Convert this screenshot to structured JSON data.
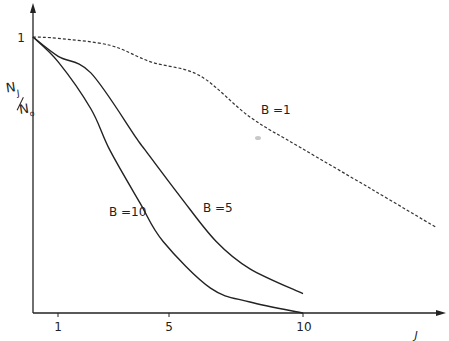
{
  "chart_data": {
    "type": "line",
    "title": "",
    "xlabel": "J",
    "ylabel": "N_J / N_0",
    "ylabel_parts": {
      "num": "N",
      "num_sub": "J",
      "den": "N",
      "den_sub": "o"
    },
    "xlim": [
      0,
      15
    ],
    "ylim": [
      0,
      1
    ],
    "x_ticks": [
      1,
      5,
      10
    ],
    "y_ticks": [
      1
    ],
    "grid": false,
    "legend": "inline labels",
    "series": [
      {
        "name": "B = 1",
        "label": "B =1",
        "style": "dashed",
        "x": [
          0,
          1,
          2.9,
          4.4,
          6.2,
          8.05,
          9.9,
          12.5,
          14.9
        ],
        "y": [
          1.0,
          0.995,
          0.97,
          0.91,
          0.86,
          0.71,
          0.6,
          0.45,
          0.31
        ]
      },
      {
        "name": "B = 5",
        "label": "B =5",
        "style": "solid",
        "x": [
          0,
          1,
          2.2,
          3.9,
          4.2,
          5.5,
          6.8,
          8.05,
          10
        ],
        "y": [
          1.0,
          0.93,
          0.87,
          0.63,
          0.59,
          0.42,
          0.26,
          0.16,
          0.07
        ]
      },
      {
        "name": "B = 10",
        "label": "B =10",
        "style": "solid",
        "x": [
          0,
          1,
          2.2,
          2.9,
          4.0,
          4.85,
          6.6,
          8.05,
          10
        ],
        "y": [
          1.0,
          0.91,
          0.74,
          0.59,
          0.4,
          0.26,
          0.09,
          0.04,
          0.0
        ]
      }
    ]
  },
  "labels": {
    "y_tick_1": "1",
    "x_tick_1": "1",
    "x_tick_5": "5",
    "x_tick_10": "10",
    "x_axis": "J",
    "y_num": "N",
    "y_num_sub": "J",
    "y_den": "N",
    "y_den_sub": "o",
    "b1": "B =1",
    "b5": "B =5",
    "b10": "B =10"
  }
}
